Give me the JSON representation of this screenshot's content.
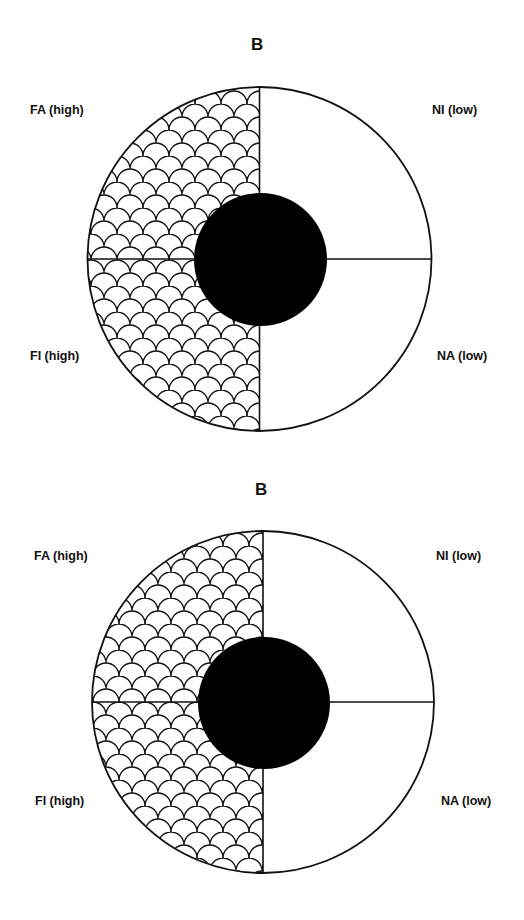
{
  "diagrams": [
    {
      "title": "B",
      "quadrants": {
        "top_left": {
          "label": "FA (high)",
          "fill": "scale-pattern"
        },
        "top_right": {
          "label": "NI (low)",
          "fill": "none"
        },
        "bottom_left": {
          "label": "FI (high)",
          "fill": "scale-pattern"
        },
        "bottom_right": {
          "label": "NA (low)",
          "fill": "none"
        }
      },
      "center_disc": {
        "color": "#000000"
      }
    },
    {
      "title": "B",
      "quadrants": {
        "top_left": {
          "label": "FA (high)",
          "fill": "scale-pattern"
        },
        "top_right": {
          "label": "NI (low)",
          "fill": "none"
        },
        "bottom_left": {
          "label": "FI (high)",
          "fill": "scale-pattern"
        },
        "bottom_right": {
          "label": "NA (low)",
          "fill": "none"
        }
      },
      "center_disc": {
        "color": "#000000"
      }
    }
  ],
  "colors": {
    "stroke": "#111111",
    "background": "#ffffff",
    "center_disc": "#000000"
  }
}
